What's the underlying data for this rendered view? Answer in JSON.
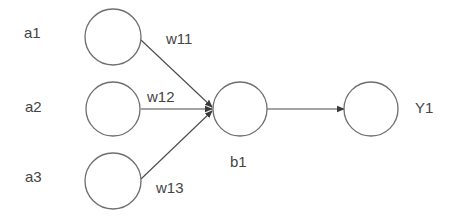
{
  "diagram": {
    "type": "neural-network-single-neuron",
    "colors": {
      "background": "#ffffff",
      "node_stroke": "#6e6e6e",
      "edge": "#4a4a4a",
      "text": "#444444"
    },
    "nodes": {
      "a1": {
        "label": "a1",
        "cx": 113,
        "cy": 37,
        "r": 28
      },
      "a2": {
        "label": "a2",
        "cx": 113,
        "cy": 109,
        "r": 27
      },
      "a3": {
        "label": "a3",
        "cx": 113,
        "cy": 181,
        "r": 28
      },
      "b1": {
        "label": "b1",
        "cx": 240,
        "cy": 109,
        "r": 27
      },
      "y1": {
        "label": "Y1",
        "cx": 371,
        "cy": 109,
        "r": 27
      }
    },
    "edges": {
      "a1_b1": {
        "from": "a1",
        "to": "b1",
        "label": "w11"
      },
      "a2_b1": {
        "from": "a2",
        "to": "b1",
        "label": "w12"
      },
      "a3_b1": {
        "from": "a3",
        "to": "b1",
        "label": "w13"
      },
      "b1_y1": {
        "from": "b1",
        "to": "Y1",
        "label": ""
      }
    }
  }
}
